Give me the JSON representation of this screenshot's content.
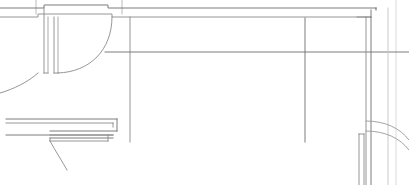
{
  "document": {
    "type": "cad-floor-plan",
    "title": "Architectural Floor Plan Fragment",
    "width": 409,
    "height": 185,
    "background_color": "#ffffff",
    "line_color_dark": "#4a4a4a",
    "line_color_mid": "#6e6e6e",
    "line_color_light": "#a8a8a8",
    "line_color_faint": "#c4c4c4"
  },
  "geometry": {
    "walls": [
      {
        "name": "top-outer-wall-line",
        "kind": "polyline",
        "color": "#6e6e6e",
        "width": 0.9,
        "points": "0,8 44,8 44,5 108,5 108,8 376,8"
      },
      {
        "name": "top-inner-wall-line",
        "kind": "polyline",
        "color": "#8a8a8a",
        "width": 0.9,
        "points": "0,17 38,17 38,14 112,14 112,17 371,17"
      },
      {
        "name": "top-right-wall-return",
        "kind": "polyline",
        "color": "#8a8a8a",
        "width": 0.9,
        "points": "357,17 371,17"
      },
      {
        "name": "left-jamb-outer-vertical",
        "kind": "polyline",
        "color": "#8a8a8a",
        "width": 0.9,
        "points": "44,8 44,73"
      },
      {
        "name": "left-jamb-inner-vertical",
        "kind": "polyline",
        "color": "#a0a0a0",
        "width": 0.9,
        "points": "48,17 48,73"
      },
      {
        "name": "door-leaf-outer-vertical",
        "kind": "polyline",
        "color": "#8a8a8a",
        "width": 0.9,
        "points": "54,17 54,73"
      },
      {
        "name": "door-leaf-inner-vertical",
        "kind": "polyline",
        "color": "#a0a0a0",
        "width": 0.9,
        "points": "58,17 58,73"
      },
      {
        "name": "door-leaf-bottom-cap",
        "kind": "polyline",
        "color": "#8a8a8a",
        "width": 0.9,
        "points": "54,73 58,73"
      },
      {
        "name": "left-jamb-bottom-cap",
        "kind": "polyline",
        "color": "#8a8a8a",
        "width": 0.9,
        "points": "44,73 48,73"
      },
      {
        "name": "room-left-vertical-wall",
        "kind": "polyline",
        "color": "#8a8a8a",
        "width": 0.9,
        "points": "130,17 130,142"
      },
      {
        "name": "room-mid-vertical-wall",
        "kind": "polyline",
        "color": "#6e6e6e",
        "width": 0.9,
        "points": "305,18 305,142"
      },
      {
        "name": "room-horizontal-datum",
        "kind": "polyline",
        "color": "#6e6e6e",
        "width": 0.9,
        "points": "105,52 409,52"
      },
      {
        "name": "right-wall-outer-vertical",
        "kind": "polyline",
        "color": "#6e6e6e",
        "width": 1.1,
        "points": "376,8 376,10"
      },
      {
        "name": "right-wall-face-a",
        "kind": "polyline",
        "color": "#6e6e6e",
        "width": 0.9,
        "points": "371,10 371,185"
      },
      {
        "name": "right-wall-face-b",
        "kind": "polyline",
        "color": "#8a8a8a",
        "width": 0.9,
        "points": "366,17 366,185"
      },
      {
        "name": "right-wall-face-c",
        "kind": "polyline",
        "color": "#c4c4c4",
        "width": 0.9,
        "points": "388,8 388,185"
      },
      {
        "name": "right-post-left-edge",
        "kind": "polyline",
        "color": "#8a8a8a",
        "width": 0.9,
        "points": "359,134 359,185"
      },
      {
        "name": "right-post-right-edge",
        "kind": "polyline",
        "color": "#8a8a8a",
        "width": 0.9,
        "points": "364,134 364,185"
      },
      {
        "name": "right-post-top-cap",
        "kind": "polyline",
        "color": "#8a8a8a",
        "width": 0.9,
        "points": "359,134 364,134"
      }
    ],
    "door_swings": [
      {
        "name": "door-swing-arc-upper",
        "kind": "path",
        "color": "#8a8a8a",
        "width": 0.9,
        "d": "M 112,17 C 112,50 90,72 58,73"
      },
      {
        "name": "door-swing-arc-lower-left",
        "kind": "path",
        "color": "#8a8a8a",
        "width": 0.9,
        "d": "M 38,73 C 28,82 14,89 0,93"
      },
      {
        "name": "door-swing-arc-bottom-left",
        "kind": "path",
        "color": "#8a8a8a",
        "width": 0.9,
        "d": "M 50,141 C 56,152 62,161 67,170"
      }
    ],
    "lower_left_block": [
      {
        "name": "lower-block-top-line",
        "kind": "polyline",
        "color": "#6e6e6e",
        "width": 0.9,
        "points": "6,119 117,119"
      },
      {
        "name": "lower-block-second-line",
        "kind": "polyline",
        "color": "#8a8a8a",
        "width": 0.9,
        "points": "6,123 113,123"
      },
      {
        "name": "lower-block-step-riser",
        "kind": "polyline",
        "color": "#6e6e6e",
        "width": 0.9,
        "points": "117,119 117,131"
      },
      {
        "name": "lower-block-inner-riser",
        "kind": "polyline",
        "color": "#8a8a8a",
        "width": 0.9,
        "points": "113,123 113,127"
      },
      {
        "name": "lower-block-step-tread",
        "kind": "polyline",
        "color": "#6e6e6e",
        "width": 0.9,
        "points": "50,131 117,131"
      },
      {
        "name": "lower-block-bottom-line",
        "kind": "polyline",
        "color": "#6e6e6e",
        "width": 0.9,
        "points": "6,135 113,135"
      },
      {
        "name": "lower-block-bottom-return",
        "kind": "polyline",
        "color": "#8a8a8a",
        "width": 0.9,
        "points": "50,135 113,135"
      },
      {
        "name": "lower-block-sill-top",
        "kind": "polyline",
        "color": "#6e6e6e",
        "width": 0.9,
        "points": "50,138 113,138"
      },
      {
        "name": "lower-block-sill-bottom",
        "kind": "polyline",
        "color": "#8a8a8a",
        "width": 0.9,
        "points": "50,141 108,141"
      },
      {
        "name": "lower-block-sill-left-cap",
        "kind": "polyline",
        "color": "#8a8a8a",
        "width": 0.9,
        "points": "50,138 50,141"
      },
      {
        "name": "lower-block-right-cap",
        "kind": "polyline",
        "color": "#8a8a8a",
        "width": 0.9,
        "points": "108,135 108,141"
      }
    ],
    "annotation_marks": [
      {
        "name": "tick-mark-upper-left",
        "kind": "polyline",
        "color": "#a8a8a8",
        "width": 0.8,
        "points": "36,0 36,14"
      },
      {
        "name": "tick-mark-upper-mid",
        "kind": "polyline",
        "color": "#a8a8a8",
        "width": 0.8,
        "points": "122,0 122,14"
      },
      {
        "name": "guide-vertical-far-right",
        "kind": "polyline",
        "color": "#d0d0d0",
        "width": 0.8,
        "points": "396,0 396,185"
      }
    ],
    "curved_leaders": [
      {
        "name": "leader-arc-upper",
        "kind": "path",
        "color": "#9a9a9a",
        "width": 0.9,
        "d": "M 366,121 C 385,121 400,128 409,140"
      },
      {
        "name": "leader-arc-lower",
        "kind": "path",
        "color": "#9a9a9a",
        "width": 0.9,
        "d": "M 366,131 C 385,131 400,138 409,150"
      }
    ]
  }
}
